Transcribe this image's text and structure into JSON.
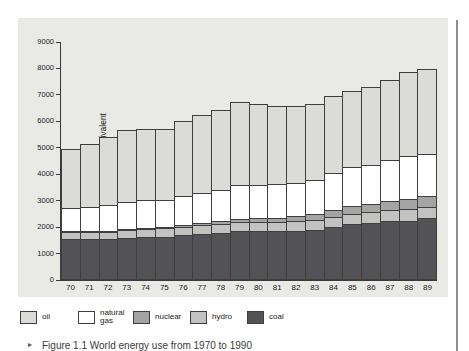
{
  "figure": {
    "caption_marker": "▸",
    "caption": "Figure 1.1  World energy use from 1970 to 1990"
  },
  "colors": {
    "panel_background": "#e9e9e6",
    "page_background": "#ffffff",
    "axis": "#3a3a3a",
    "page_edge_line": "#8f8f8f"
  },
  "chart_data": {
    "type": "bar",
    "stacked": true,
    "title": "",
    "xlabel": "",
    "ylabel": "million tonnes oil equivalent",
    "ylim": [
      0,
      9000
    ],
    "yticks": [
      0,
      1000,
      2000,
      3000,
      4000,
      5000,
      6000,
      7000,
      8000,
      9000
    ],
    "grid": false,
    "legend_position": "bottom",
    "categories": [
      "70",
      "71",
      "72",
      "73",
      "74",
      "75",
      "76",
      "77",
      "78",
      "79",
      "80",
      "81",
      "82",
      "83",
      "84",
      "85",
      "86",
      "87",
      "88",
      "89"
    ],
    "series": [
      {
        "name": "coal",
        "color": "#525257",
        "values": [
          1550,
          1550,
          1550,
          1600,
          1620,
          1640,
          1700,
          1750,
          1780,
          1850,
          1850,
          1850,
          1870,
          1900,
          2000,
          2100,
          2150,
          2220,
          2250,
          2330
        ]
      },
      {
        "name": "hydro",
        "color": "#c2c2c0",
        "values": [
          300,
          310,
          320,
          330,
          350,
          350,
          360,
          360,
          370,
          380,
          390,
          400,
          410,
          420,
          430,
          440,
          450,
          450,
          470,
          480
        ]
      },
      {
        "name": "nuclear",
        "color": "#a4a4a4",
        "values": [
          30,
          40,
          50,
          60,
          80,
          100,
          110,
          130,
          150,
          160,
          170,
          190,
          210,
          240,
          290,
          340,
          360,
          390,
          420,
          430
        ]
      },
      {
        "name": "natural gas",
        "color": "#ffffff",
        "values": [
          900,
          950,
          1000,
          1050,
          1080,
          1060,
          1130,
          1170,
          1220,
          1300,
          1300,
          1310,
          1310,
          1330,
          1440,
          1490,
          1500,
          1580,
          1650,
          1640
        ]
      },
      {
        "name": "oil",
        "color": "#dbdbd7",
        "values": [
          2270,
          2400,
          2600,
          2760,
          2720,
          2700,
          2880,
          2970,
          3080,
          3190,
          3080,
          2980,
          2940,
          2910,
          2940,
          2920,
          2980,
          3060,
          3210,
          3270
        ]
      }
    ],
    "legend": [
      {
        "label": "oil",
        "color": "#dbdbd7",
        "left": 2
      },
      {
        "label": "natural\ngas",
        "color": "#ffffff",
        "left": 60
      },
      {
        "label": "nuclear",
        "color": "#a4a4a4",
        "left": 115
      },
      {
        "label": "hydro",
        "color": "#c2c2c0",
        "left": 172
      },
      {
        "label": "coal",
        "color": "#525257",
        "left": 229
      }
    ]
  }
}
